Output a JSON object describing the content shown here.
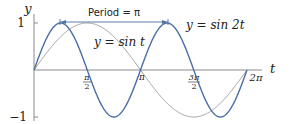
{
  "chart_data": {
    "type": "line",
    "title": "",
    "xlabel": "t",
    "ylabel": "y",
    "xlim": [
      0,
      6.2832
    ],
    "ylim": [
      -1,
      1
    ],
    "grid": false,
    "x_ticks": [
      {
        "value": 1.5708,
        "label_num": "π",
        "label_den": "2"
      },
      {
        "value": 3.1416,
        "label": "π"
      },
      {
        "value": 4.7124,
        "label_num": "3π",
        "label_den": "2"
      },
      {
        "value": 6.2832,
        "label": "2π"
      }
    ],
    "y_ticks": [
      {
        "value": 1,
        "label": "1"
      },
      {
        "value": -1,
        "label": "−1"
      }
    ],
    "series": [
      {
        "name": "y = sin t",
        "function": "sin(t)",
        "color": "#999999",
        "x": [
          0,
          0.7854,
          1.5708,
          2.3562,
          3.1416,
          3.927,
          4.7124,
          5.4978,
          6.2832
        ],
        "values": [
          0,
          0.707,
          1,
          0.707,
          0,
          -0.707,
          -1,
          -0.707,
          0
        ]
      },
      {
        "name": "y = sin 2t",
        "function": "sin(2t)",
        "color": "#4a6fa5",
        "x": [
          0,
          0.7854,
          1.5708,
          2.3562,
          3.1416,
          3.927,
          4.7124,
          5.4978,
          6.2832
        ],
        "values": [
          0,
          1,
          0,
          -1,
          0,
          1,
          0,
          -1,
          0
        ]
      }
    ],
    "annotations": [
      {
        "text": "Period = π",
        "type": "double-arrow",
        "from_t": 0.7854,
        "to_t": 3.927,
        "y": 1
      }
    ],
    "legend": "inline labels"
  },
  "labels": {
    "y_axis": "y",
    "t_axis": "t",
    "y_one": "1",
    "y_neg_one": "−1",
    "tick_pi_half_num": "π",
    "tick_pi_half_den": "2",
    "tick_pi": "π",
    "tick_3pi_half_num": "3π",
    "tick_3pi_half_den": "2",
    "tick_2pi": "2π",
    "period": "Period = π",
    "sin_t": "y = sin t",
    "sin_2t": "y = sin 2t"
  },
  "colors": {
    "sin_2t": "#4a6fa5",
    "sin_t": "#999999",
    "axis": "#8a8a8a",
    "arrow": "#4a6fa5"
  }
}
